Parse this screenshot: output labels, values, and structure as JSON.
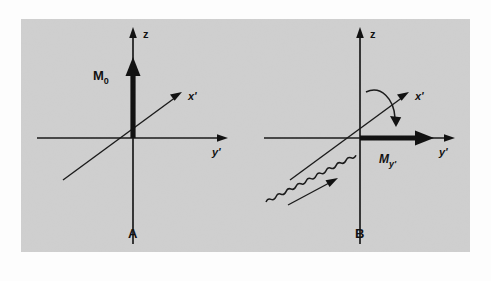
{
  "figure": {
    "background_color": "#cfcfcf",
    "page_color": "#fdfdfd",
    "ink_color": "#111111"
  },
  "panels": [
    {
      "id": "A",
      "label": "A",
      "axes": {
        "z_label": "z",
        "x_label": "x'",
        "y_label": "y'"
      },
      "vectors": [
        {
          "name": "equilibrium-magnetization",
          "label": "M",
          "subscript": "0",
          "direction": "along +z",
          "style": "bold"
        }
      ],
      "annotations": []
    },
    {
      "id": "B",
      "label": "B",
      "axes": {
        "z_label": "z",
        "x_label": "x'",
        "y_label": "y'"
      },
      "vectors": [
        {
          "name": "transverse-magnetization",
          "label": "M",
          "subscript": "y'",
          "direction": "along +y'",
          "style": "bold"
        }
      ],
      "annotations": [
        {
          "name": "rf-pulse-wave",
          "description": "sinusoidal wave travelling toward origin along x'"
        },
        {
          "name": "rotation-curve",
          "description": "curved arrow indicating tipping of magnetization"
        }
      ]
    }
  ]
}
